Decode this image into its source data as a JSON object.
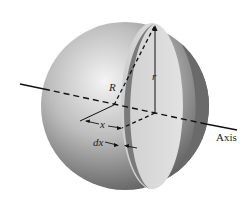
{
  "diagram": {
    "labels": {
      "big_radius": "R",
      "small_radius": "r",
      "distance": "x",
      "thickness": "dx",
      "axis": "Axis"
    },
    "colors": {
      "sphere_light": "#f2f2f2",
      "sphere_dark": "#5a5a5a",
      "slice_face": "#d9d9d9",
      "slice_rim": "#7a7a7a",
      "line": "#111111"
    }
  }
}
